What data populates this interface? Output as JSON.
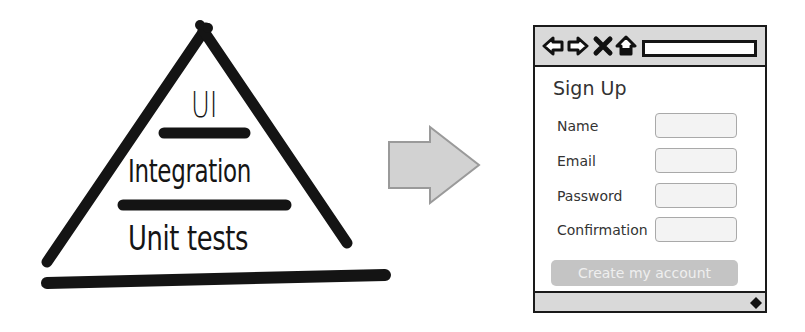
{
  "pyramid": {
    "levels": [
      {
        "label": "UI"
      },
      {
        "label": "Integration"
      },
      {
        "label": "Unit tests"
      }
    ]
  },
  "arrow": {
    "icon": "right-arrow-icon",
    "fill": "#d2d2d2",
    "stroke": "#9a9a9a"
  },
  "browser": {
    "toolbar": {
      "icons": [
        "back-arrow-icon",
        "forward-arrow-icon",
        "stop-x-icon",
        "home-icon"
      ],
      "url_value": ""
    },
    "form": {
      "title": "Sign Up",
      "fields": [
        {
          "label": "Name",
          "value": ""
        },
        {
          "label": "Email",
          "value": ""
        },
        {
          "label": "Password",
          "value": ""
        },
        {
          "label": "Confirmation",
          "value": ""
        }
      ],
      "submit_label": "Create my account"
    },
    "colors": {
      "chrome": "#d9d9d9",
      "frame": "#1a1a1a",
      "button": "#c4c4c4"
    }
  }
}
